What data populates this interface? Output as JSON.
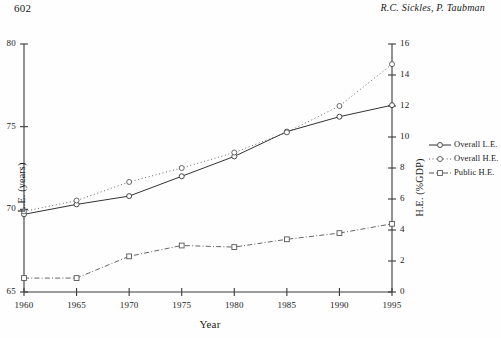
{
  "header": {
    "page_number": "602",
    "running_head": "R.C. Sickles, P. Taubman"
  },
  "chart_data": {
    "type": "line",
    "title": "",
    "xlabel": "Year",
    "ylabel": "L.E. (years)",
    "ylabel_right": "H.E. (%GDP)",
    "x": [
      1960,
      1965,
      1970,
      1975,
      1980,
      1985,
      1990,
      1995
    ],
    "xtick_labels": [
      "1960",
      "1965",
      "1970",
      "1975",
      "1980",
      "1985",
      "1990",
      "1995"
    ],
    "xlim": [
      1960,
      1995
    ],
    "ylim": [
      65,
      80
    ],
    "ytick_labels": [
      "65",
      "70",
      "75",
      "80"
    ],
    "yticks": [
      65,
      70,
      75,
      80
    ],
    "ylim_right": [
      0,
      16
    ],
    "ytick_labels_right": [
      "0",
      "2",
      "4",
      "6",
      "8",
      "10",
      "12",
      "14",
      "16"
    ],
    "yticks_right": [
      0,
      2,
      4,
      6,
      8,
      10,
      12,
      14,
      16
    ],
    "grid": false,
    "legend_position": "right-middle",
    "series": [
      {
        "name": "Overall L.E.",
        "axis": "left",
        "style": "solid",
        "marker": "circle",
        "color": "#333333",
        "values": [
          69.7,
          70.3,
          70.8,
          72.0,
          73.2,
          74.7,
          75.6,
          76.3
        ]
      },
      {
        "name": "Overall H.E.",
        "axis": "right",
        "style": "dotted",
        "marker": "circle",
        "color": "#555555",
        "values": [
          5.2,
          5.9,
          7.1,
          8.0,
          9.0,
          10.3,
          12.0,
          14.7
        ]
      },
      {
        "name": "Public H.E.",
        "axis": "right",
        "style": "dashdot",
        "marker": "square",
        "color": "#555555",
        "values": [
          0.9,
          0.9,
          2.3,
          3.0,
          2.9,
          3.4,
          3.8,
          4.4
        ]
      }
    ]
  },
  "legend": {
    "items": [
      {
        "label": "Overall L.E.",
        "style": "solid",
        "marker": "circle"
      },
      {
        "label": "Overall H.E.",
        "style": "dotted",
        "marker": "circle"
      },
      {
        "label": "Public H.E.",
        "style": "dashdot",
        "marker": "square"
      }
    ]
  }
}
